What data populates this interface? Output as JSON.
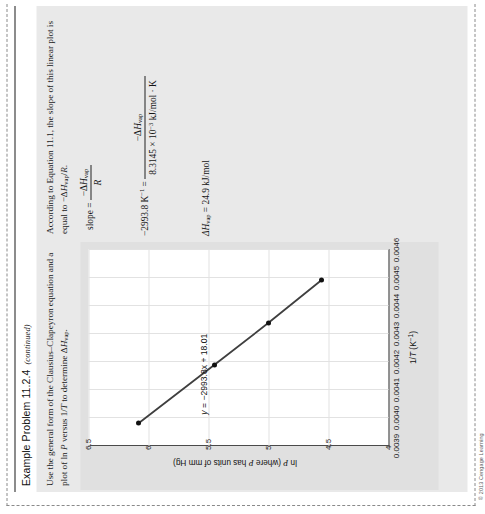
{
  "page": {
    "copyright": "© 2013 Cengage Learning"
  },
  "example": {
    "title": "Example Problem 11.2.4",
    "title_note": "(continued)",
    "prompt_line1": "Use the general form of the Clausius–Clapeyron equation and a plot of ln ",
    "prompt_italic_P": "P",
    "prompt_line2": " versus 1/",
    "prompt_italic_T": "T",
    "prompt_line3": " to determine Δ",
    "prompt_italic_H": "H",
    "prompt_sub_vap": "vap",
    "prompt_end": "."
  },
  "solution": {
    "intro_a": "According to Equation 11.1, the slope of this linear plot is equal to −Δ",
    "intro_H": "H",
    "intro_sub": "vap",
    "intro_b": "/",
    "intro_R": "R",
    "intro_c": ".",
    "eq1_lhs": "slope =",
    "eq1_num_minus": "−Δ",
    "eq1_num_H": "H",
    "eq1_num_sub": "vap",
    "eq1_den": "R",
    "eq2_lhs_val": "−2993.8 K",
    "eq2_lhs_exp": "−1",
    "eq2_eq": "=",
    "eq2_num_minus": "−Δ",
    "eq2_num_H": "H",
    "eq2_num_sub": "vap",
    "eq2_den_a": "8.3145 × 10",
    "eq2_den_exp": "−3",
    "eq2_den_b": " kJ/mol · K",
    "eq3_H": "ΔH",
    "eq3_sub": "vap",
    "eq3_rest": " = 24.9 kJ/mol"
  },
  "chart_data": {
    "type": "scatter",
    "title": "",
    "xlabel": "1/T (K−1)",
    "xlabel_parts": {
      "pre": "1/",
      "italic": "T",
      "post": " (K",
      "sup": "−1",
      "close": ")"
    },
    "ylabel": "ln P (where P has units of mm Hg)",
    "ylabel_parts": {
      "a": "ln ",
      "b": "P",
      "c": " (where ",
      "d": "P",
      "e": " has units of mm Hg)"
    },
    "xlim": [
      0.0039,
      0.0046
    ],
    "ylim": [
      4,
      6.5
    ],
    "xticks": [
      "0.0039",
      "0.0040",
      "0.0041",
      "0.0042",
      "0.0043",
      "0.0044",
      "0.0045",
      "0.0046"
    ],
    "xtick_values": [
      0.0039,
      0.004,
      0.0041,
      0.0042,
      0.0043,
      0.0044,
      0.0045,
      0.0046
    ],
    "yticks": [
      "4",
      "4.5",
      "5",
      "5.5",
      "6",
      "6.5"
    ],
    "ytick_values": [
      4,
      4.5,
      5,
      5.5,
      6,
      6.5
    ],
    "grid": true,
    "legend": "none",
    "annotation": "y = −2993.8x + 18.01",
    "annotation_parts": {
      "y": "y",
      "rest": " = −2993.8x + 18.01"
    },
    "series": [
      {
        "name": "ln P vs 1/T",
        "marker": "filled-circle",
        "line": true,
        "color": "#3f3f3f",
        "x": [
          0.003982,
          0.00419,
          0.00434,
          0.004492
        ],
        "y": [
          6.08,
          5.45,
          5.0,
          4.56
        ]
      }
    ],
    "fit": {
      "slope": -2993.8,
      "intercept": 18.01
    }
  }
}
